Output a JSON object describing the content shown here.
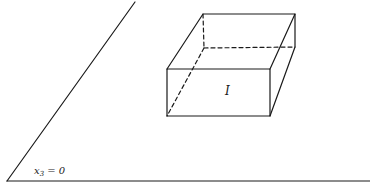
{
  "diagram": {
    "type": "geometric-illustration",
    "colors": {
      "stroke": "#1a1a1a",
      "background": "#ffffff"
    },
    "plane": {
      "label_main": "x",
      "label_subscript": "3",
      "label_rest": " = 0",
      "edge_top": [
        135,
        2
      ],
      "corner": [
        7,
        181
      ],
      "base_right": [
        370,
        181
      ]
    },
    "box": {
      "label": "I",
      "vertices": {
        "front_top_left": [
          167,
          69
        ],
        "front_top_right": [
          270,
          69
        ],
        "front_bottom_left": [
          167,
          116
        ],
        "front_bottom_right": [
          270,
          116
        ],
        "back_top_left": [
          203,
          14
        ],
        "back_top_right": [
          295,
          14
        ],
        "back_bottom_left": [
          204,
          48
        ],
        "back_bottom_right": [
          295,
          47
        ]
      }
    }
  }
}
